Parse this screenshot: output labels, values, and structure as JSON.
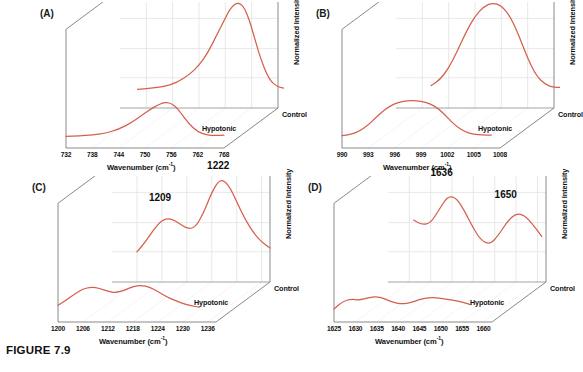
{
  "figure": {
    "caption": "FIGURE 7.9",
    "curve_color": "#d4604c",
    "frame_color": "#7d7d7d",
    "grid_color": "#e2e2e2",
    "axis_title": "Wavenumber (cm",
    "axis_title_sup": "-1",
    "axis_title_end": ")",
    "zaxis_title": "Normalized Intensity",
    "series_front": "Hypotonic",
    "series_back": "Control"
  },
  "chart_data": [
    {
      "id": "A",
      "type": "line",
      "panel_label": "(A)",
      "title": "",
      "xlabel": "Wavenumber (cm-1)",
      "ylabel": "Normalized Intensity",
      "xlim": [
        732,
        768
      ],
      "ticks": [
        732,
        738,
        744,
        750,
        756,
        762,
        768
      ],
      "annotations": [
        {
          "text": "752",
          "x": 758,
          "y": 0.96
        }
      ],
      "legend_position": "right-depth",
      "grid": true,
      "series": [
        {
          "name": "Control",
          "x": [
            736,
            739,
            742,
            745,
            748,
            750,
            752,
            754,
            756,
            757,
            758,
            759,
            760,
            761,
            762,
            764,
            766,
            768,
            770
          ],
          "values": [
            0.1,
            0.11,
            0.13,
            0.17,
            0.26,
            0.35,
            0.48,
            0.66,
            0.84,
            0.93,
            0.98,
            1.0,
            0.97,
            0.88,
            0.74,
            0.42,
            0.2,
            0.12,
            0.11
          ]
        },
        {
          "name": "Hypotonic",
          "x": [
            732,
            735,
            738,
            741,
            744,
            747,
            749,
            751,
            753,
            754,
            755,
            756,
            757,
            758,
            760,
            762,
            764,
            766,
            768
          ],
          "values": [
            0.08,
            0.085,
            0.1,
            0.13,
            0.19,
            0.3,
            0.4,
            0.5,
            0.58,
            0.61,
            0.62,
            0.6,
            0.55,
            0.47,
            0.28,
            0.15,
            0.1,
            0.09,
            0.1
          ]
        }
      ]
    },
    {
      "id": "B",
      "type": "line",
      "panel_label": "(B)",
      "title": "",
      "xlabel": "Wavenumber (cm-1)",
      "ylabel": "Normalized Intensity",
      "xlim": [
        990,
        1008
      ],
      "ticks": [
        990,
        993,
        996,
        999,
        1002,
        1005,
        1008
      ],
      "annotations": [
        {
          "text": "999",
          "x": 1001,
          "y": 0.97
        }
      ],
      "legend_position": "right-depth",
      "grid": true,
      "series": [
        {
          "name": "Control",
          "x": [
            994,
            995,
            996,
            997,
            998,
            999,
            1000,
            1001,
            1002,
            1003,
            1004,
            1005,
            1006,
            1007,
            1008,
            1009
          ],
          "values": [
            0.14,
            0.2,
            0.32,
            0.5,
            0.7,
            0.86,
            0.96,
            1.0,
            0.97,
            0.86,
            0.66,
            0.42,
            0.24,
            0.15,
            0.12,
            0.12
          ]
        },
        {
          "name": "Hypotonic",
          "x": [
            990,
            991,
            992,
            993,
            994,
            995,
            996,
            997,
            998,
            999,
            1000,
            1001,
            1002,
            1003,
            1004,
            1005,
            1006,
            1007
          ],
          "values": [
            0.09,
            0.11,
            0.16,
            0.26,
            0.4,
            0.52,
            0.6,
            0.64,
            0.65,
            0.64,
            0.6,
            0.52,
            0.38,
            0.24,
            0.15,
            0.11,
            0.1,
            0.1
          ]
        }
      ]
    },
    {
      "id": "C",
      "type": "line",
      "panel_label": "(C)",
      "title": "",
      "xlabel": "Wavenumber (cm-1)",
      "ylabel": "Normalized Intensity",
      "xlim": [
        1200,
        1238
      ],
      "ticks": [
        1200,
        1206,
        1212,
        1218,
        1224,
        1230,
        1236
      ],
      "annotations": [
        {
          "text": "1209",
          "x": 1212,
          "y": 0.7
        },
        {
          "text": "1222",
          "x": 1226,
          "y": 0.98
        }
      ],
      "legend_position": "right-depth",
      "grid": true,
      "series": [
        {
          "name": "Control",
          "x": [
            1206,
            1208,
            1210,
            1212,
            1214,
            1216,
            1218,
            1220,
            1222,
            1224,
            1226,
            1228,
            1230,
            1232,
            1234,
            1236,
            1238
          ],
          "values": [
            0.22,
            0.32,
            0.45,
            0.55,
            0.57,
            0.52,
            0.46,
            0.47,
            0.62,
            0.84,
            0.98,
            0.92,
            0.74,
            0.56,
            0.42,
            0.32,
            0.26
          ]
        },
        {
          "name": "Hypotonic",
          "x": [
            1200,
            1202,
            1204,
            1206,
            1208,
            1210,
            1212,
            1214,
            1216,
            1218,
            1220,
            1222,
            1224,
            1226,
            1228,
            1230,
            1232,
            1234
          ],
          "values": [
            0.16,
            0.24,
            0.34,
            0.42,
            0.45,
            0.43,
            0.38,
            0.36,
            0.4,
            0.46,
            0.48,
            0.45,
            0.38,
            0.3,
            0.24,
            0.19,
            0.15,
            0.13
          ]
        }
      ]
    },
    {
      "id": "D",
      "type": "line",
      "panel_label": "(D)",
      "title": "",
      "xlabel": "Wavenumber (cm-1)",
      "ylabel": "Normalized Intensity",
      "xlim": [
        1625,
        1662
      ],
      "ticks": [
        1625,
        1630,
        1635,
        1640,
        1645,
        1650,
        1655,
        1660
      ],
      "annotations": [
        {
          "text": "1636",
          "x": 1638,
          "y": 0.92
        },
        {
          "text": "1650",
          "x": 1653,
          "y": 0.72
        }
      ],
      "legend_position": "right-depth",
      "grid": true,
      "series": [
        {
          "name": "Control",
          "x": [
            1631,
            1633,
            1635,
            1637,
            1639,
            1641,
            1643,
            1645,
            1647,
            1649,
            1651,
            1653,
            1655,
            1657,
            1659,
            1661
          ],
          "values": [
            0.55,
            0.5,
            0.52,
            0.66,
            0.8,
            0.78,
            0.64,
            0.46,
            0.33,
            0.3,
            0.4,
            0.54,
            0.62,
            0.6,
            0.5,
            0.38
          ]
        },
        {
          "name": "Hypotonic",
          "x": [
            1625,
            1627,
            1629,
            1631,
            1633,
            1635,
            1637,
            1639,
            1641,
            1643,
            1645,
            1647,
            1649,
            1651,
            1653,
            1655,
            1657
          ],
          "values": [
            0.1,
            0.22,
            0.26,
            0.24,
            0.28,
            0.3,
            0.26,
            0.2,
            0.18,
            0.2,
            0.25,
            0.28,
            0.28,
            0.26,
            0.24,
            0.21,
            0.17
          ]
        }
      ]
    }
  ]
}
